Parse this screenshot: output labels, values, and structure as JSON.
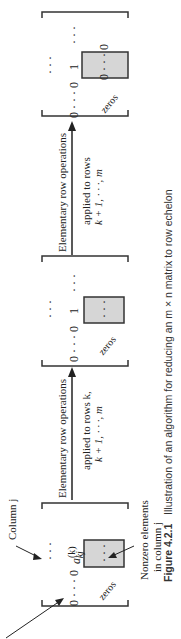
{
  "figure": {
    "orientation": "rotated 90deg counter-clockwise",
    "caption": {
      "label": "Figure 4.2.1",
      "text": "Illustration of an algorithm for reducing an m × n matrix to row echelon"
    },
    "annotations": {
      "column_j": "Column j",
      "nonzero_line1": "Nonzero elements",
      "nonzero_line2": "in column j"
    },
    "matrices": [
      {
        "name": "matrix-1",
        "row_prefix": "0 · · · 0",
        "pivot": "a",
        "pivot_sup": "(k)",
        "pivot_sub": "kj",
        "leading_dots": "· · ·",
        "box_content": "· · ·",
        "below_label": "zeros"
      },
      {
        "name": "matrix-2",
        "row_prefix": "0 · · · 0",
        "pivot": "1",
        "leading_dots": "· · ·",
        "trailing_dots": "· · ·",
        "box_content": "· · ·",
        "below_label": "zeros"
      },
      {
        "name": "matrix-3",
        "row_prefix": "0 · · · 0",
        "pivot": "1",
        "leading_dots": "· · ·",
        "trailing_dots": "· · ·",
        "box_content": "0 · · · 0",
        "below_label": "zeros"
      }
    ],
    "arrows": [
      {
        "top_label": "Elementary row operations",
        "bottom_line1": "applied to rows k,",
        "bottom_line2": "k + 1, · · ·, m"
      },
      {
        "top_label": "Elementary row operations",
        "bottom_line1": "applied to rows",
        "bottom_line2": "k + 1, · · ·, m"
      }
    ],
    "colors": {
      "ink": "#222222",
      "box_fill": "#d6d6d6",
      "background": "#ffffff"
    }
  }
}
